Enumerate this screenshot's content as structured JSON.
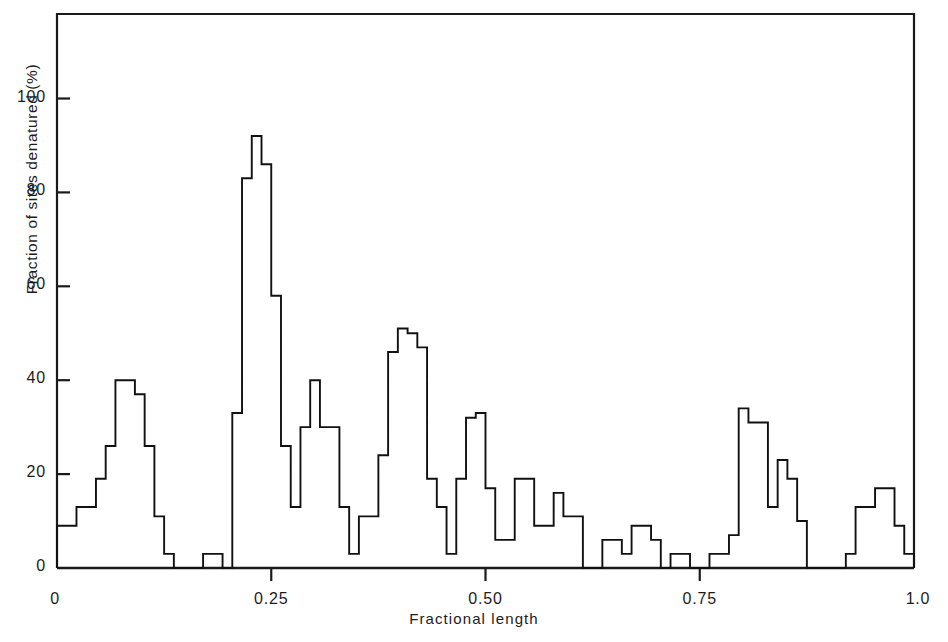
{
  "chart_data": {
    "type": "bar",
    "title": "",
    "xlabel": "Fractional length",
    "ylabel": "Fraction of sites denatured (%)",
    "xlim": [
      0,
      1.0
    ],
    "ylim": [
      0,
      118
    ],
    "grid": false,
    "legend": "none",
    "style": "step-histogram-outline",
    "bin_width": 0.0125,
    "xticks": [
      {
        "value": 0,
        "label": "0"
      },
      {
        "value": 0.25,
        "label": "0.25"
      },
      {
        "value": 0.5,
        "label": "0.50"
      },
      {
        "value": 0.75,
        "label": "0.75"
      },
      {
        "value": 1.0,
        "label": "1.0"
      }
    ],
    "yticks": [
      {
        "value": 0,
        "label": "0"
      },
      {
        "value": 20,
        "label": "20"
      },
      {
        "value": 40,
        "label": "40"
      },
      {
        "value": 60,
        "label": "60"
      },
      {
        "value": 80,
        "label": "80"
      },
      {
        "value": 100,
        "label": "100"
      }
    ],
    "x": [
      0.0,
      0.0125,
      0.025,
      0.0375,
      0.05,
      0.0625,
      0.075,
      0.0875,
      0.1,
      0.1125,
      0.125,
      0.1375,
      0.15,
      0.1625,
      0.175,
      0.1875,
      0.2,
      0.2125,
      0.225,
      0.2375,
      0.25,
      0.2625,
      0.275,
      0.2875,
      0.3,
      0.3125,
      0.325,
      0.3375,
      0.35,
      0.3625,
      0.375,
      0.3875,
      0.4,
      0.4125,
      0.425,
      0.4375,
      0.45,
      0.4625,
      0.475,
      0.4875,
      0.5,
      0.5125,
      0.525,
      0.5375,
      0.55,
      0.5625,
      0.575,
      0.5875,
      0.6,
      0.6125,
      0.625,
      0.6375,
      0.65,
      0.6625,
      0.675,
      0.6875,
      0.7,
      0.7125,
      0.725,
      0.7375,
      0.75,
      0.7625,
      0.775,
      0.7875,
      0.8,
      0.8125,
      0.825,
      0.8375,
      0.85,
      0.8625,
      0.875,
      0.8875,
      0.9,
      0.9125,
      0.925,
      0.9375,
      0.95,
      0.9625,
      0.975,
      0.9875
    ],
    "values": [
      9,
      9,
      13,
      13,
      19,
      26,
      40,
      40,
      37,
      26,
      11,
      3,
      0,
      0,
      0,
      3,
      3,
      0,
      33,
      83,
      92,
      86,
      58,
      26,
      13,
      30,
      40,
      30,
      30,
      13,
      3,
      11,
      11,
      24,
      46,
      51,
      50,
      47,
      19,
      13,
      3,
      19,
      32,
      33,
      17,
      6,
      6,
      19,
      19,
      9,
      9,
      16,
      11,
      11,
      0,
      0,
      6,
      6,
      3,
      9,
      9,
      6,
      0,
      3,
      3,
      0,
      0,
      3,
      3,
      7,
      34,
      31,
      31,
      13,
      23,
      19,
      10,
      0,
      0,
      0
    ],
    "values_tail": [
      0,
      3,
      13,
      13,
      17,
      17,
      9,
      3
    ]
  }
}
